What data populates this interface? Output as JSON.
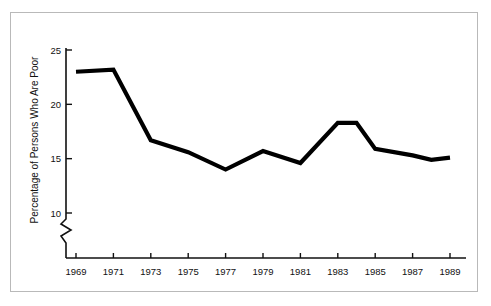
{
  "chart_data": {
    "type": "line",
    "title": "",
    "xlabel": "",
    "ylabel": "Percentage of Persons Who Are Poor",
    "xlim": [
      1969,
      1989
    ],
    "ylim": [
      8.6,
      25
    ],
    "yticks": [
      10,
      15,
      20,
      25
    ],
    "ytick_labels": [
      "10",
      "15",
      "20",
      "25"
    ],
    "xticks": [
      1969,
      1971,
      1973,
      1975,
      1977,
      1979,
      1981,
      1983,
      1985,
      1987,
      1989
    ],
    "xtick_labels": [
      "1969",
      "1971",
      "1973",
      "1975",
      "1977",
      "1979",
      "1981",
      "1983",
      "1985",
      "1987",
      "1989"
    ],
    "grid": false,
    "legend": false,
    "axis_break": {
      "axis": "y",
      "below_value": 10,
      "style": "zigzag"
    },
    "x": [
      1969,
      1971,
      1973,
      1975,
      1977,
      1979,
      1981,
      1983,
      1984,
      1985,
      1987,
      1988,
      1989
    ],
    "values": [
      23.0,
      23.2,
      16.7,
      15.6,
      14.0,
      15.7,
      14.6,
      18.3,
      18.3,
      15.9,
      15.3,
      14.9,
      15.1
    ],
    "series": [
      {
        "name": "Percentage of Persons Who Are Poor",
        "color": "#000000",
        "values": [
          23.0,
          23.2,
          16.7,
          15.6,
          14.0,
          15.7,
          14.6,
          18.3,
          18.3,
          15.9,
          15.3,
          14.9,
          15.1
        ]
      }
    ]
  },
  "colors": {
    "line": "#000000",
    "axis": "#111111",
    "frame": "#b9b9b9",
    "background": "#ffffff"
  },
  "geometry": {
    "y_axis_x": 66,
    "x_axis_y": 258,
    "x_axis_end": 466,
    "y_top": 50,
    "y_break_top": 219,
    "y_break_bottom": 243,
    "plot_x_start": 76,
    "plot_x_end": 450
  }
}
